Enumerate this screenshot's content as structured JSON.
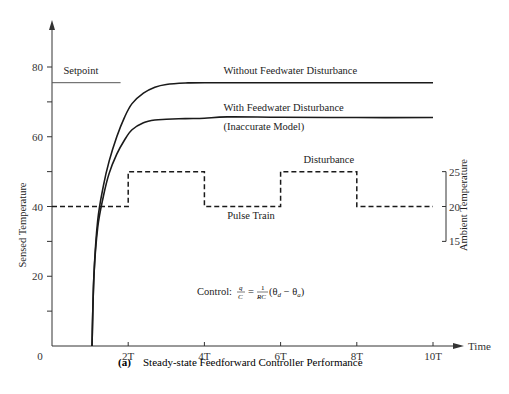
{
  "chart_data": {
    "type": "line",
    "title": "Steady-state Feedforward Controller Performance",
    "caption_label": "(a)",
    "xlabel": "Time",
    "ylabel": "Sensed Temperature",
    "y2label": "Ambient Temperature",
    "xlim": [
      0,
      10.5
    ],
    "ylim": [
      0,
      90
    ],
    "y2lim": [
      15,
      25
    ],
    "x_ticks": [
      {
        "v": 0,
        "label": "0"
      },
      {
        "v": 2,
        "label": "2T"
      },
      {
        "v": 4,
        "label": "4T"
      },
      {
        "v": 6,
        "label": "6T"
      },
      {
        "v": 8,
        "label": "8T"
      },
      {
        "v": 10,
        "label": "10T"
      }
    ],
    "y_ticks": [
      {
        "v": 10,
        "label": ""
      },
      {
        "v": 20,
        "label": "20"
      },
      {
        "v": 30,
        "label": ""
      },
      {
        "v": 40,
        "label": "40"
      },
      {
        "v": 50,
        "label": ""
      },
      {
        "v": 60,
        "label": "60"
      },
      {
        "v": 70,
        "label": ""
      },
      {
        "v": 80,
        "label": "80"
      }
    ],
    "y2_ticks": [
      {
        "v": 25,
        "label": "25",
        "y": 50
      },
      {
        "v": 20,
        "label": "20",
        "y": 40
      },
      {
        "v": 15,
        "label": "15",
        "y": 30
      }
    ],
    "series": [
      {
        "name": "Setpoint",
        "style": "solid-thin",
        "x": [
          0,
          1.8
        ],
        "y": [
          75.5,
          75.5
        ]
      },
      {
        "name": "Without Feedwater Disturbance",
        "style": "solid",
        "x": [
          1.05,
          1.1,
          1.2,
          1.35,
          1.5,
          1.7,
          1.9,
          2.1,
          2.4,
          2.7,
          3.0,
          3.5,
          4,
          6,
          8,
          10
        ],
        "y": [
          0,
          20,
          36,
          46,
          53,
          60,
          65.5,
          69.5,
          72.5,
          74.2,
          75,
          75.4,
          75.5,
          75.5,
          75.5,
          75.5
        ]
      },
      {
        "name": "With Feedwater Disturbance (Inaccurate Model)",
        "style": "solid",
        "x": [
          1.05,
          1.1,
          1.2,
          1.35,
          1.5,
          1.7,
          1.9,
          2.1,
          2.4,
          2.7,
          3.0,
          3.5,
          4,
          4.6,
          6,
          8,
          10
        ],
        "y": [
          0,
          20,
          34,
          43,
          49.5,
          55,
          59,
          62,
          64,
          64.8,
          65,
          65.2,
          65.3,
          65.7,
          65.6,
          65.5,
          65.5
        ]
      },
      {
        "name": "Pulse Train (Disturbance)",
        "style": "dashed",
        "axis": "y2",
        "x": [
          0,
          2,
          2,
          4,
          4,
          6,
          6,
          8,
          8,
          10
        ],
        "y2": [
          20,
          20,
          25,
          25,
          20,
          20,
          25,
          25,
          20,
          20
        ]
      }
    ],
    "annotations": [
      {
        "text": "Setpoint",
        "x": 0.3,
        "y": 78
      },
      {
        "text": "Without Feedwater Disturbance",
        "x": 4.5,
        "y": 78
      },
      {
        "text": "With Feedwater Disturbance",
        "x": 4.5,
        "y": 67.5
      },
      {
        "text": "(Inaccurate Model)",
        "x": 4.5,
        "y": 62
      },
      {
        "text": "Disturbance",
        "x": 6.6,
        "y": 52.5
      },
      {
        "text": "Pulse Train",
        "x": 4.6,
        "y": 36.5
      }
    ],
    "formula": {
      "prefix": "Control:",
      "lhs_num": "q",
      "lhs_den": "C",
      "eq": "=",
      "rhs_num": "1",
      "rhs_den": "RC",
      "rhs_paren": "(θ",
      "sub_d": "d",
      "minus": " − θ",
      "sub_a": "a",
      "close": ")"
    },
    "grid": false,
    "legend": "none"
  }
}
